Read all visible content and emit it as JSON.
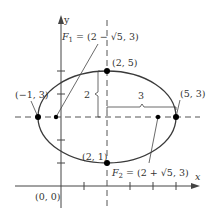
{
  "diagram": {
    "type": "ellipse-graph",
    "colors": {
      "axis": "#444444",
      "curve": "#3a3a3a",
      "dashed": "#555555",
      "text": "#333333",
      "point": "#000000"
    },
    "axes": {
      "x_label": "x",
      "y_label": "y",
      "origin_label": "(0, 0)"
    },
    "points": {
      "left_vertex": "(−1, 3)",
      "right_vertex": "(5, 3)",
      "top_vertex": "(2, 5)",
      "bottom_vertex": "(2, 1)"
    },
    "foci": {
      "f1_name": "F",
      "f1_sub": "1",
      "f1_value": " = (2 − √5, 3)",
      "f2_name": "F",
      "f2_sub": "2",
      "f2_value": " = (2 + √5, 3)"
    },
    "dimensions": {
      "semi_minor": "2",
      "semi_major": "3"
    },
    "equation_params": {
      "center": [
        2,
        3
      ],
      "a": 3,
      "b": 2,
      "c": "√5"
    }
  }
}
